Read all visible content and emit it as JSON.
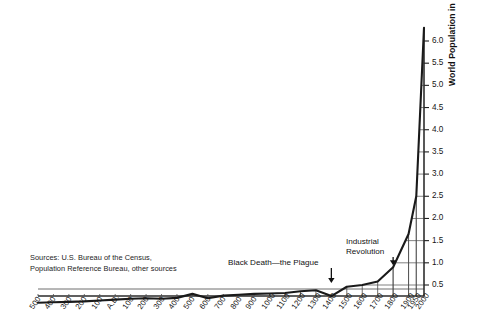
{
  "figure": {
    "source_note_line1": "Sources: U.S. Bureau of the Census,",
    "source_note_line2": "Population Reference Bureau, other sources",
    "y_axis_title": "World Population in Billions",
    "annotation_black_death_line1": "Black Death—the Plague",
    "annotation_industrial_line1": "Industrial",
    "annotation_industrial_line2": "Revolution",
    "line_color": "#1a1a1a",
    "grid_color": "#3a3a3a",
    "background_color": "#ffffff"
  },
  "chart_data": {
    "type": "line",
    "title": "",
    "xlabel": "",
    "ylabel": "World Population in Billions",
    "grid": true,
    "legend": false,
    "ylim": [
      0,
      6.6
    ],
    "yticks": [
      0.5,
      1.0,
      1.5,
      2.0,
      2.5,
      3.0,
      3.5,
      4.0,
      4.5,
      5.0,
      5.5,
      6.0
    ],
    "ytick_labels": [
      "0.5",
      "1.0",
      "1.5",
      "2.0",
      "2.5",
      "3.0",
      "3.5",
      "4.0",
      "4.5",
      "5.0",
      "5.5",
      "6.0"
    ],
    "xtick_labels": [
      "500",
      "400",
      "300",
      "200",
      "100",
      "A.D.",
      "100",
      "200",
      "300",
      "400",
      "500",
      "600",
      "700",
      "800",
      "900",
      "1000",
      "1100",
      "1200",
      "1300",
      "1400",
      "1500",
      "1600",
      "1700",
      "1800",
      "1900",
      "1950",
      "2000"
    ],
    "x": [
      -500,
      -400,
      -300,
      -200,
      -100,
      0,
      100,
      200,
      300,
      400,
      500,
      600,
      700,
      800,
      900,
      1000,
      1100,
      1200,
      1300,
      1400,
      1500,
      1600,
      1700,
      1800,
      1900,
      1950,
      2000
    ],
    "values": [
      0.1,
      0.11,
      0.12,
      0.13,
      0.15,
      0.17,
      0.19,
      0.2,
      0.19,
      0.21,
      0.3,
      0.2,
      0.26,
      0.28,
      0.3,
      0.31,
      0.32,
      0.36,
      0.38,
      0.25,
      0.46,
      0.5,
      0.58,
      0.9,
      1.65,
      2.5,
      6.3
    ],
    "annotations": [
      {
        "label": "Black Death—the Plague",
        "x": 1400,
        "y": 0.25
      },
      {
        "label": "Industrial Revolution",
        "x": 1800,
        "y": 0.9
      }
    ],
    "source": "Sources: U.S. Bureau of the Census, Population Reference Bureau, other sources"
  }
}
